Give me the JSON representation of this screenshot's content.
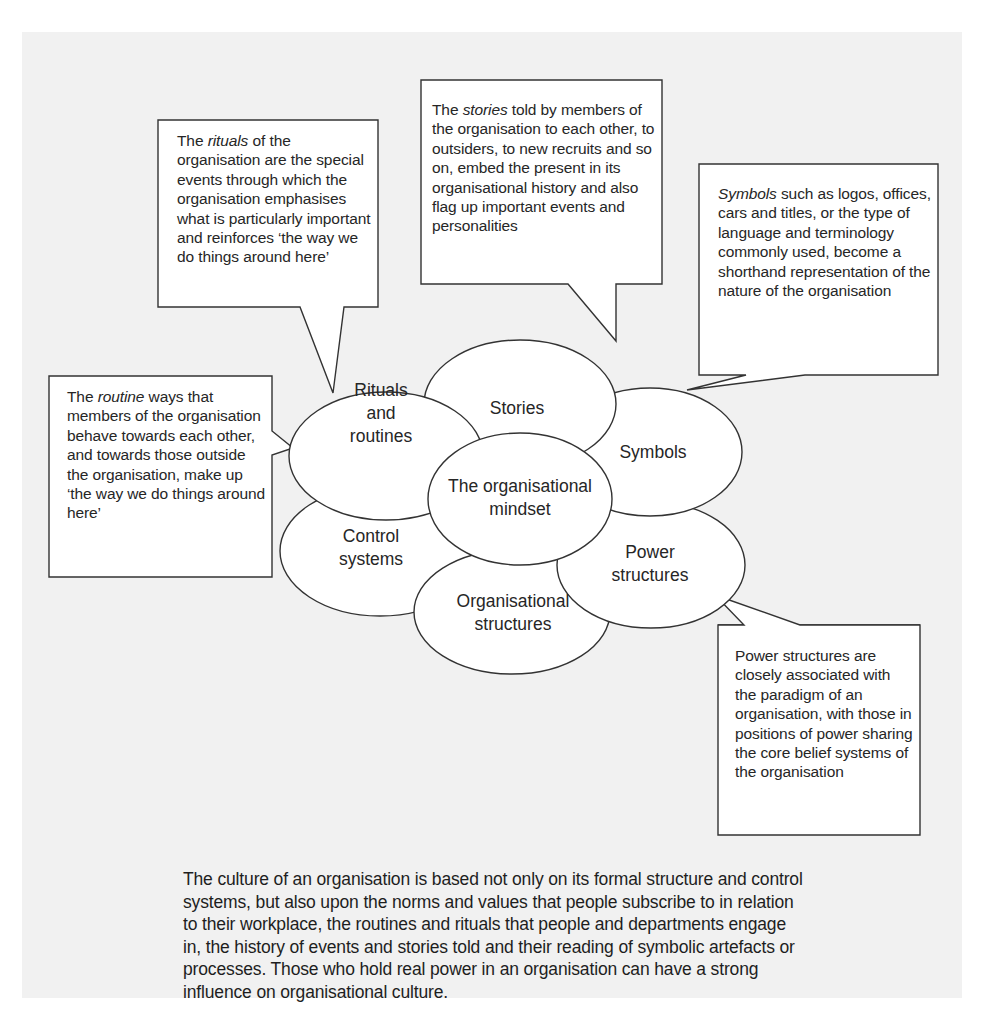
{
  "diagram": {
    "title": "The organisational mindset",
    "center": {
      "label_line1": "The organisational",
      "label_line2": "mindset"
    },
    "ellipses": [
      {
        "id": "rituals",
        "line1": "Rituals",
        "line2": "and",
        "line3": "routines"
      },
      {
        "id": "stories",
        "line1": "Stories"
      },
      {
        "id": "symbols",
        "line1": "Symbols"
      },
      {
        "id": "power",
        "line1": "Power",
        "line2": "structures"
      },
      {
        "id": "org-structures",
        "line1": "Organisational",
        "line2": "structures"
      },
      {
        "id": "control",
        "line1": "Control",
        "line2": "systems"
      }
    ],
    "callouts": {
      "rituals": {
        "pre": "The ",
        "em": "rituals",
        "post": " of the organisation are the special events through which the organisation emphasises what is particularly important and reinforces ‘the way we do things around here’"
      },
      "stories": {
        "pre": "The ",
        "em": "stories",
        "post": " told by members of the organisation to each other, to outsiders, to new recruits and so on, embed the present in its organisational history and also flag up important events and personalities"
      },
      "symbols": {
        "pre": "",
        "em": "Symbols",
        "post": " such as logos, offices, cars and titles, or the type of language and terminology commonly used, become a shorthand representation of the nature of the organisation"
      },
      "routines": {
        "pre": "The ",
        "em": "routine",
        "post": " ways that members of the organisation behave towards each other, and towards those outside the organisation, make up ‘the way we do things around here’"
      },
      "power": {
        "pre": "",
        "em": "",
        "post": "Power structures are closely associated with the paradigm of an organisation, with those in positions of power sharing the core belief systems of the organisation"
      }
    }
  },
  "caption": {
    "text": "The culture of an organisation is based not only on its formal structure and control systems, but also upon the norms and values that people subscribe to in relation to their workplace, the routines and rituals that people and departments engage in, the history of events and stories told and their reading of symbolic artefacts or processes.  Those who hold real power in an organisation can have a strong influence on organisational culture."
  },
  "colors": {
    "background": "#f1f1f1",
    "stroke": "#333333",
    "fill": "#ffffff",
    "text": "#262626"
  }
}
